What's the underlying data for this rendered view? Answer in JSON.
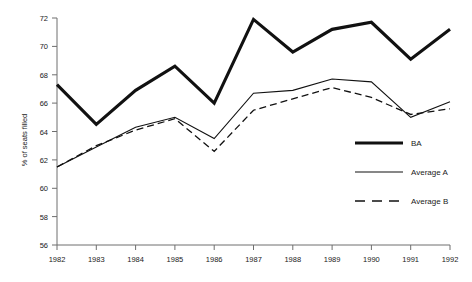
{
  "chart_data": {
    "type": "line",
    "title": "",
    "subtitle": "",
    "xlabel": "",
    "ylabel": "% of seats filled",
    "x": [
      1982,
      1983,
      1984,
      1985,
      1986,
      1987,
      1988,
      1989,
      1990,
      1991,
      1992
    ],
    "categories": [
      "1982",
      "1983",
      "1984",
      "1985",
      "1986",
      "1987",
      "1988",
      "1989",
      "1990",
      "1991",
      "1992"
    ],
    "xlim": [
      1982,
      1992
    ],
    "ylim": [
      56,
      72
    ],
    "yticks": [
      56,
      58,
      60,
      62,
      64,
      66,
      68,
      70,
      72
    ],
    "ytick_labels": [
      "56",
      "58",
      "60",
      "62",
      "64",
      "66",
      "68",
      "70",
      "72"
    ],
    "xticks": [
      1982,
      1983,
      1984,
      1985,
      1986,
      1987,
      1988,
      1989,
      1990,
      1991,
      1992
    ],
    "grid": false,
    "legend_position": "right-inside",
    "series": [
      {
        "name": "BA",
        "style": "solid-thick",
        "color": "#111111",
        "values": [
          67.3,
          64.5,
          66.9,
          68.6,
          66.0,
          71.9,
          69.6,
          71.2,
          71.7,
          69.1,
          71.2
        ]
      },
      {
        "name": "Average A",
        "style": "solid-thin",
        "color": "#111111",
        "values": [
          61.5,
          62.9,
          64.3,
          65.0,
          63.5,
          66.7,
          66.9,
          67.7,
          67.5,
          65.0,
          66.1
        ]
      },
      {
        "name": "Average B",
        "style": "dashed",
        "color": "#111111",
        "values": [
          61.5,
          63.0,
          64.1,
          64.9,
          62.6,
          65.5,
          66.3,
          67.1,
          66.4,
          65.2,
          65.6
        ]
      }
    ]
  },
  "legend": {
    "items": [
      {
        "label": "BA"
      },
      {
        "label": "Average A"
      },
      {
        "label": "Average B"
      }
    ]
  },
  "axes": {
    "y_title": "% of seats filled"
  }
}
